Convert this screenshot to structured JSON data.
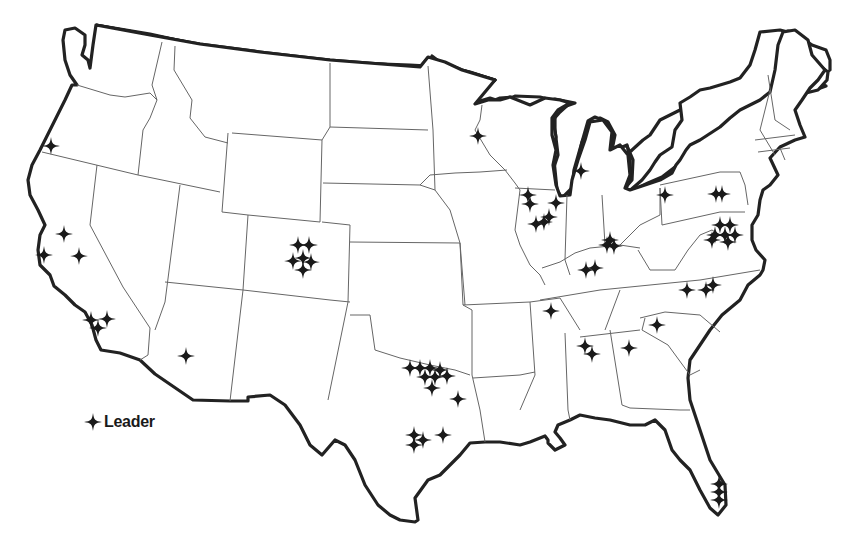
{
  "legend": {
    "symbol": "four-point-star-icon",
    "label": "Leader"
  },
  "colors": {
    "outline": "#222222",
    "state_border": "#666666",
    "marker": "#1a1a1a",
    "background": "#ffffff"
  },
  "markers": [
    {
      "region": "Oregon",
      "x": 51,
      "y": 146
    },
    {
      "region": "California",
      "x": 64,
      "y": 234
    },
    {
      "region": "California",
      "x": 44,
      "y": 255
    },
    {
      "region": "California",
      "x": 79,
      "y": 256
    },
    {
      "region": "California",
      "x": 91,
      "y": 320
    },
    {
      "region": "California",
      "x": 107,
      "y": 319
    },
    {
      "region": "California",
      "x": 98,
      "y": 328
    },
    {
      "region": "Arizona",
      "x": 186,
      "y": 356
    },
    {
      "region": "Colorado",
      "x": 298,
      "y": 245
    },
    {
      "region": "Colorado",
      "x": 309,
      "y": 245
    },
    {
      "region": "Colorado",
      "x": 293,
      "y": 261
    },
    {
      "region": "Colorado",
      "x": 303,
      "y": 258
    },
    {
      "region": "Colorado",
      "x": 311,
      "y": 262
    },
    {
      "region": "Colorado",
      "x": 303,
      "y": 270
    },
    {
      "region": "Texas",
      "x": 410,
      "y": 368
    },
    {
      "region": "Texas",
      "x": 420,
      "y": 368
    },
    {
      "region": "Texas",
      "x": 430,
      "y": 368
    },
    {
      "region": "Texas",
      "x": 440,
      "y": 370
    },
    {
      "region": "Texas",
      "x": 425,
      "y": 377
    },
    {
      "region": "Texas",
      "x": 435,
      "y": 377
    },
    {
      "region": "Texas",
      "x": 447,
      "y": 376
    },
    {
      "region": "Texas",
      "x": 432,
      "y": 388
    },
    {
      "region": "Texas",
      "x": 458,
      "y": 399
    },
    {
      "region": "Texas",
      "x": 414,
      "y": 435
    },
    {
      "region": "Texas",
      "x": 423,
      "y": 440
    },
    {
      "region": "Texas",
      "x": 414,
      "y": 445
    },
    {
      "region": "Texas",
      "x": 443,
      "y": 435
    },
    {
      "region": "Minnesota",
      "x": 478,
      "y": 136
    },
    {
      "region": "Michigan",
      "x": 581,
      "y": 171
    },
    {
      "region": "Illinois",
      "x": 528,
      "y": 195
    },
    {
      "region": "Illinois",
      "x": 530,
      "y": 204
    },
    {
      "region": "Illinois",
      "x": 556,
      "y": 203
    },
    {
      "region": "Illinois",
      "x": 549,
      "y": 217
    },
    {
      "region": "Illinois",
      "x": 536,
      "y": 224
    },
    {
      "region": "Illinois",
      "x": 544,
      "y": 222
    },
    {
      "region": "Kentucky",
      "x": 610,
      "y": 240
    },
    {
      "region": "Kentucky",
      "x": 607,
      "y": 245
    },
    {
      "region": "Kentucky",
      "x": 614,
      "y": 246
    },
    {
      "region": "Kentucky",
      "x": 586,
      "y": 270
    },
    {
      "region": "Kentucky",
      "x": 595,
      "y": 268
    },
    {
      "region": "Pennsylvania",
      "x": 665,
      "y": 195
    },
    {
      "region": "Pennsylvania",
      "x": 716,
      "y": 194
    },
    {
      "region": "Pennsylvania",
      "x": 722,
      "y": 194
    },
    {
      "region": "Maryland",
      "x": 720,
      "y": 225
    },
    {
      "region": "Maryland",
      "x": 730,
      "y": 225
    },
    {
      "region": "Maryland",
      "x": 715,
      "y": 235
    },
    {
      "region": "Maryland",
      "x": 725,
      "y": 235
    },
    {
      "region": "Maryland",
      "x": 735,
      "y": 235
    },
    {
      "region": "Maryland",
      "x": 712,
      "y": 240
    },
    {
      "region": "Maryland",
      "x": 728,
      "y": 242
    },
    {
      "region": "Tennessee",
      "x": 551,
      "y": 311
    },
    {
      "region": "North Carolina",
      "x": 687,
      "y": 290
    },
    {
      "region": "North Carolina",
      "x": 706,
      "y": 290
    },
    {
      "region": "North Carolina",
      "x": 713,
      "y": 285
    },
    {
      "region": "South Carolina",
      "x": 657,
      "y": 325
    },
    {
      "region": "Alabama",
      "x": 585,
      "y": 346
    },
    {
      "region": "Alabama",
      "x": 592,
      "y": 354
    },
    {
      "region": "Georgia",
      "x": 629,
      "y": 348
    },
    {
      "region": "Florida",
      "x": 719,
      "y": 484
    },
    {
      "region": "Florida",
      "x": 719,
      "y": 492
    },
    {
      "region": "Florida",
      "x": 719,
      "y": 500
    }
  ]
}
